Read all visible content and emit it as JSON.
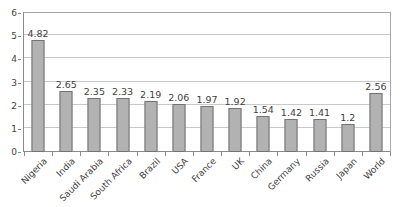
{
  "chart_data": {
    "type": "bar",
    "title": "",
    "subtitle": "",
    "xlabel": "",
    "ylabel": "",
    "ylim": [
      0,
      6
    ],
    "ytick_step": 1,
    "yticks": [
      "0",
      "1",
      "2",
      "3",
      "4",
      "5",
      "6"
    ],
    "grid": "horizontal",
    "legend": "none",
    "categories": [
      "Nigeria",
      "India",
      "Saudi Arabia",
      "South Africa",
      "Brazil",
      "USA",
      "France",
      "UK",
      "China",
      "Germany",
      "Russia",
      "Japan",
      "World"
    ],
    "values": [
      4.82,
      2.65,
      2.35,
      2.33,
      2.19,
      2.06,
      1.97,
      1.92,
      1.54,
      1.42,
      1.41,
      1.2,
      2.56
    ],
    "data_labels": [
      "4.82",
      "2.65",
      "2.35",
      "2.33",
      "2.19",
      "2.06",
      "1.97",
      "1.92",
      "1.54",
      "1.42",
      "1.41",
      "1.2",
      "2.56"
    ],
    "series": [
      {
        "name": "",
        "values": [
          4.82,
          2.65,
          2.35,
          2.33,
          2.19,
          2.06,
          1.97,
          1.92,
          1.54,
          1.42,
          1.41,
          1.2,
          2.56
        ]
      }
    ],
    "colors": {
      "bar_fill": "#b2b2b2",
      "bar_border": "#737373",
      "gridline": "#c9c9c9",
      "axis": "#8a8a8a",
      "frame": "#a6a6a6",
      "text": "#3f3f3f",
      "background": "#ffffff"
    }
  }
}
